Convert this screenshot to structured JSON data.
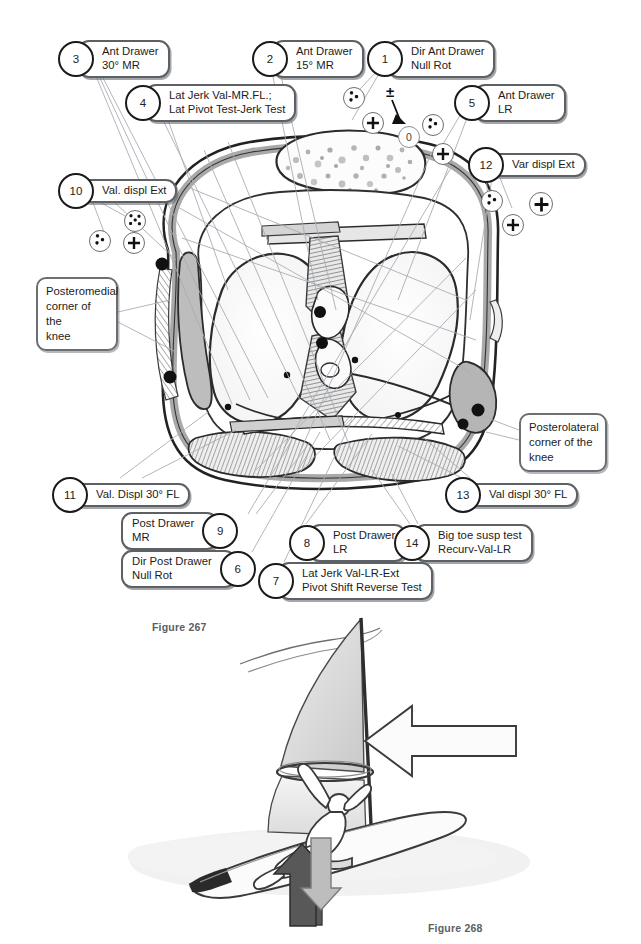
{
  "page": {
    "background": "#ffffff",
    "width": 641,
    "height": 944
  },
  "figures": [
    {
      "id": "fig-267",
      "caption": "Figure 267",
      "x": 152,
      "y": 621
    },
    {
      "id": "fig-268",
      "caption": "Figure 268",
      "x": 428,
      "y": 922
    }
  ],
  "diagram": {
    "title_implied": "Axial cross-section of the knee with laxity test callouts",
    "callouts": [
      {
        "num": "3",
        "lines": "Ant Drawer\n30° MR",
        "x": 58,
        "y": 40,
        "side": "left"
      },
      {
        "num": "2",
        "lines": "Ant Drawer\n15° MR",
        "x": 252,
        "y": 40,
        "side": "left"
      },
      {
        "num": "1",
        "lines": "Dir Ant Drawer\nNull Rot",
        "x": 367,
        "y": 40,
        "side": "left"
      },
      {
        "num": "4",
        "lines": "Lat Jerk Val-MR.FL.;\nLat Pivot Test-Jerk Test",
        "x": 125,
        "y": 84,
        "side": "left"
      },
      {
        "num": "5",
        "lines": "Ant Drawer\nLR",
        "x": 454,
        "y": 84,
        "side": "left"
      },
      {
        "num": "12",
        "lines": "Var displ Ext",
        "x": 468,
        "y": 147,
        "side": "left"
      },
      {
        "num": "10",
        "lines": "Val. displ Ext",
        "x": 58,
        "y": 173,
        "side": "left"
      },
      {
        "num": "11",
        "lines": "Val. Displ 30° FL",
        "x": 52,
        "y": 477,
        "side": "left"
      },
      {
        "num": "13",
        "lines": "Val displ 30° FL",
        "x": 445,
        "y": 477,
        "side": "left"
      },
      {
        "num": "9",
        "lines": "Post Drawer\nMR",
        "x": 121,
        "y": 512,
        "side": "right"
      },
      {
        "num": "8",
        "lines": "Post Drawer\nLR",
        "x": 289,
        "y": 524,
        "side": "left"
      },
      {
        "num": "14",
        "lines": "Big toe susp test\nRecurv-Val-LR",
        "x": 394,
        "y": 524,
        "side": "left"
      },
      {
        "num": "6",
        "lines": "Dir Post Drawer\nNull Rot",
        "x": 121,
        "y": 550,
        "side": "right"
      },
      {
        "num": "7",
        "lines": "Lat Jerk Val-LR-Ext\nPivot Shift Reverse Test",
        "x": 258,
        "y": 562,
        "side": "left"
      }
    ],
    "plain_boxes": [
      {
        "id": "posteromedial",
        "text": "Posteromedial\ncorner of the\nknee",
        "x": 36,
        "y": 277,
        "w": 82,
        "h": 54
      },
      {
        "id": "posterolateral",
        "text": "Posterolateral\ncorner of the\nknee",
        "x": 519,
        "y": 413,
        "w": 88,
        "h": 54
      }
    ],
    "grade_symbols": [
      {
        "id": "s-pp-1",
        "glyph": "++",
        "x": 343,
        "y": 87,
        "type": "double"
      },
      {
        "id": "s-pm-1",
        "glyph": "±",
        "x": 389,
        "y": 86,
        "type": "plusminus"
      },
      {
        "id": "s-p-1",
        "glyph": "+",
        "x": 362,
        "y": 112,
        "type": "single"
      },
      {
        "id": "s-zero-1",
        "glyph": "0",
        "x": 398,
        "y": 126,
        "type": "zero"
      },
      {
        "id": "s-pp-2",
        "glyph": "++",
        "x": 422,
        "y": 114,
        "type": "double"
      },
      {
        "id": "s-p-2",
        "glyph": "+",
        "x": 432,
        "y": 143,
        "type": "single"
      },
      {
        "id": "s-ppp-1",
        "glyph": "+++",
        "x": 124,
        "y": 210,
        "type": "triple"
      },
      {
        "id": "s-pp-3",
        "glyph": "++",
        "x": 89,
        "y": 230,
        "type": "double"
      },
      {
        "id": "s-p-3",
        "glyph": "+",
        "x": 123,
        "y": 232,
        "type": "single"
      },
      {
        "id": "s-pp-4",
        "glyph": "++",
        "x": 481,
        "y": 190,
        "type": "double"
      },
      {
        "id": "s-p-4",
        "glyph": "+",
        "x": 529,
        "y": 192,
        "type": "single"
      },
      {
        "id": "s-p-5",
        "glyph": "+",
        "x": 502,
        "y": 214,
        "type": "single"
      }
    ],
    "colors": {
      "outline": "#1a1a1a",
      "pill_border": "#5d6166",
      "leader_line": "#9aa0a6",
      "tissue_light": "#f2f2f2",
      "tissue_mid": "#c9c9c9",
      "tissue_dark": "#8a8a8a",
      "bone_speckle": "#b0b0b0"
    }
  },
  "windsurfer": {
    "arrows": [
      {
        "id": "wind-force-arrow",
        "direction": "left",
        "color": "#f7f7f7"
      },
      {
        "id": "ground-react-arrow",
        "direction": "up",
        "color": "#585858"
      },
      {
        "id": "load-arrow",
        "direction": "down",
        "color": "#b8b8b8"
      }
    ],
    "sail_color": "#d8d8d8",
    "board_color": "#fafafa",
    "water_color": "#f0f0f0"
  }
}
